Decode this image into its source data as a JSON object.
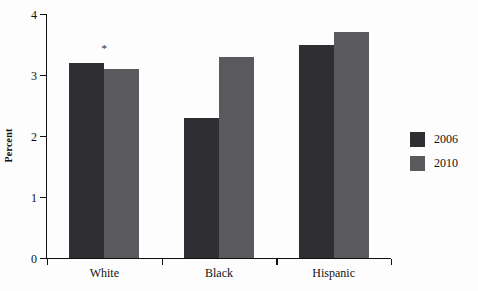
{
  "chart_data": {
    "type": "bar",
    "title": "",
    "subtitle": "",
    "xlabel": "",
    "ylabel": "Percent",
    "categories": [
      "White",
      "Black",
      "Hispanic"
    ],
    "series": [
      {
        "name": "2006",
        "color": "#2f2f33",
        "values": [
          3.2,
          2.3,
          3.5
        ]
      },
      {
        "name": "2010",
        "color": "#5a5a5e",
        "values": [
          3.1,
          3.3,
          3.7
        ]
      }
    ],
    "ylim": [
      0,
      4
    ],
    "yticks": [
      0,
      1,
      2,
      3,
      4
    ],
    "ytick_labels": [
      "0",
      "1",
      "2",
      "3",
      "4"
    ],
    "grid": false,
    "legend_position": "right",
    "annotations": [
      {
        "text": "*",
        "category": "White",
        "value": 3.35,
        "note": "significance marker above White group"
      }
    ]
  },
  "colors": {
    "series_2006": "#2f2f33",
    "series_2010": "#5a5a5e",
    "axis": "#111111",
    "background": "#fdfdfd"
  }
}
